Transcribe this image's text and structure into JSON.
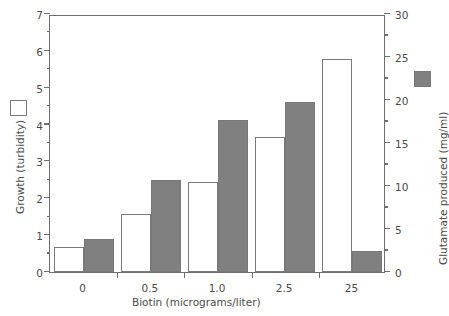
{
  "chart_data": {
    "type": "bar",
    "title": "",
    "xlabel": "Biotin (micrograms/liter)",
    "categories": [
      "0",
      "0.5",
      "1.0",
      "2.5",
      "25"
    ],
    "grid": false,
    "legend_position": "outside-left-and-right",
    "series": [
      {
        "name": "Growth (turbidity)",
        "style": "open",
        "axis": "left",
        "color": "#ffffff",
        "edge_color": "#7a7a7a",
        "values": [
          0.67,
          1.58,
          2.43,
          3.67,
          5.78
        ]
      },
      {
        "name": "Glutamate produced (mg/ml)",
        "style": "filled",
        "axis": "right",
        "color": "#808080",
        "edge_color": "#787878",
        "values": [
          3.8,
          10.7,
          17.7,
          19.8,
          2.5
        ]
      }
    ],
    "axes": {
      "left": {
        "label": "Growth (turbidity)",
        "lim": [
          0,
          7
        ],
        "major_ticks": [
          0,
          1,
          2,
          3,
          4,
          5,
          6,
          7
        ],
        "minor_ticks": [
          0.5,
          1.5,
          2.5,
          3.5,
          4.5,
          5.5,
          6.5
        ],
        "tick_labels": [
          "0",
          "1",
          "2",
          "3",
          "4",
          "5",
          "6",
          "7"
        ]
      },
      "right": {
        "label": "Glutamate produced (mg/ml)",
        "lim": [
          0,
          30
        ],
        "major_ticks": [
          0,
          5,
          10,
          15,
          20,
          25,
          30
        ],
        "minor_ticks": [
          2.5,
          7.5,
          12.5,
          17.5,
          22.5,
          27.5
        ],
        "tick_labels": [
          "0",
          "5",
          "10",
          "15",
          "20",
          "25",
          "30"
        ]
      },
      "bottom": {
        "label": "Biotin (micrograms/liter)",
        "tick_labels": [
          "0",
          "0.5",
          "1.0",
          "2.5",
          "25"
        ]
      }
    },
    "legend": [
      {
        "label": "",
        "style": "open",
        "meaning": "Growth (turbidity)"
      },
      {
        "label": "",
        "style": "filled",
        "meaning": "Glutamate produced (mg/ml)"
      }
    ]
  }
}
